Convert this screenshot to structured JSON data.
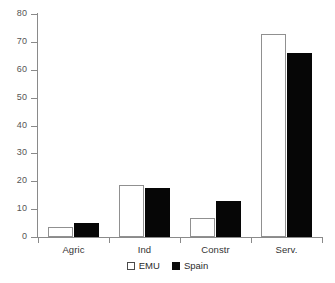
{
  "chart_data": {
    "type": "bar",
    "title": "",
    "subtitle": "",
    "xlabel": "",
    "ylabel": "",
    "categories": [
      "Agric",
      "Ind",
      "Constr",
      "Serv."
    ],
    "series": [
      {
        "name": "EMU",
        "values": [
          3.5,
          18.5,
          7,
          73
        ],
        "color": "#ffffff",
        "edge_color": "#909090"
      },
      {
        "name": "Spain",
        "values": [
          5,
          17.5,
          13,
          66
        ],
        "color": "#060606",
        "edge_color": "#060606"
      }
    ],
    "ylim": [
      0,
      80
    ],
    "yticks": [
      0,
      10,
      20,
      30,
      40,
      50,
      60,
      70,
      80
    ],
    "ytick_labels": [
      "0",
      "10",
      "20",
      "30",
      "40",
      "50",
      "60",
      "70",
      "80"
    ],
    "grid": false,
    "legend_position": "bottom-center",
    "axis_color": "#8a8a8a",
    "tick_label_color": "#555555",
    "category_label_color": "#333333",
    "background": "#ffffff"
  },
  "legend": {
    "items": [
      {
        "label": "EMU",
        "style": "open-square"
      },
      {
        "label": "Spain",
        "style": "filled-square"
      }
    ]
  }
}
